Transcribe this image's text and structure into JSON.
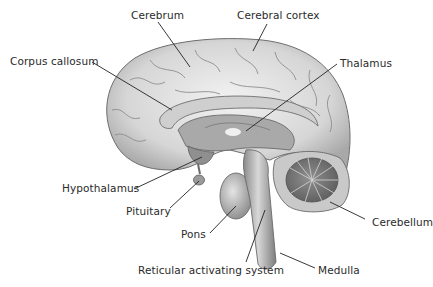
{
  "diagram": {
    "colors": {
      "line": "#222222",
      "text": "#2a2a2a",
      "tissue": "#d9d9d9",
      "tissue_dark": "#9a9a9a",
      "outline": "#6e6e6e"
    },
    "labels": [
      {
        "id": "cerebrum",
        "text": "Cerebrum",
        "x": 131,
        "y": 9,
        "line": [
          158,
          22,
          190,
          67
        ]
      },
      {
        "id": "cerebral-cortex",
        "text": "Cerebral cortex",
        "x": 237,
        "y": 9,
        "line": [
          267,
          24,
          253,
          51
        ]
      },
      {
        "id": "corpus-callosum",
        "text": "Corpus callosum",
        "x": 10,
        "y": 55,
        "line": [
          92,
          62,
          172,
          110
        ]
      },
      {
        "id": "thalamus",
        "text": "Thalamus",
        "x": 340,
        "y": 57,
        "line": [
          337,
          64,
          246,
          131
        ]
      },
      {
        "id": "hypothalamus",
        "text": "Hypothalamus",
        "x": 62,
        "y": 182,
        "line": [
          134,
          189,
          202,
          157
        ]
      },
      {
        "id": "pituitary",
        "text": "Pituitary",
        "x": 126,
        "y": 205,
        "line": [
          170,
          208,
          199,
          181
        ]
      },
      {
        "id": "pons",
        "text": "Pons",
        "x": 181,
        "y": 228,
        "line": [
          210,
          233,
          236,
          206
        ]
      },
      {
        "id": "reticular-activating-system",
        "text": "Reticular activating system",
        "x": 138,
        "y": 264,
        "line": [
          246,
          262,
          265,
          210
        ]
      },
      {
        "id": "medulla",
        "text": "Medulla",
        "x": 318,
        "y": 264,
        "line": [
          315,
          268,
          280,
          253
        ]
      },
      {
        "id": "cerebellum",
        "text": "Cerebellum",
        "x": 372,
        "y": 216,
        "line": [
          365,
          219,
          330,
          202
        ]
      }
    ]
  }
}
